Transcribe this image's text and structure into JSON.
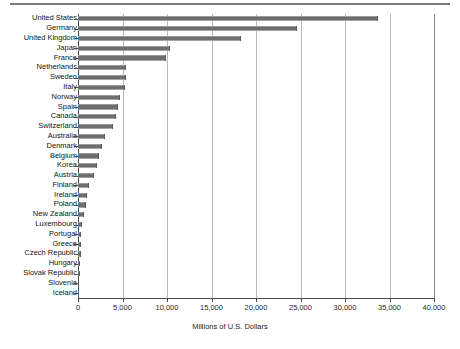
{
  "chart_data": {
    "type": "bar",
    "orientation": "horizontal",
    "title": "",
    "xlabel": "Millions of U.S. Dollars",
    "ylabel": "",
    "xlim": [
      0,
      40000
    ],
    "xticks": [
      0,
      5000,
      10000,
      15000,
      20000,
      25000,
      30000,
      35000,
      40000
    ],
    "xticklabels": [
      "0",
      "5,000",
      "10,000",
      "15,000",
      "20,000",
      "25,000",
      "30,000",
      "35,000",
      "40,000"
    ],
    "grid": "vertical",
    "legend": "none",
    "bar_color": "#6e6e6e",
    "categories": [
      "United States",
      "Germany",
      "United Kingdom",
      "Japan",
      "France",
      "Netherlands",
      "Sweden",
      "Italy",
      "Norway",
      "Spain",
      "Canada",
      "Switzerland",
      "Australia",
      "Denmark",
      "Belgium",
      "Korea",
      "Austria",
      "Finland",
      "Ireland",
      "Poland",
      "New Zealand",
      "Luxembourg",
      "Portugal",
      "Greece",
      "Czech Republic",
      "Hungary",
      "Slovak Republic",
      "Slovenia",
      "Iceland"
    ],
    "values": [
      33700,
      24600,
      18300,
      10300,
      9900,
      5400,
      5400,
      5300,
      4700,
      4450,
      4250,
      3950,
      3050,
      2650,
      2350,
      2100,
      1800,
      1200,
      1000,
      950,
      620,
      400,
      380,
      350,
      330,
      260,
      200,
      120,
      60
    ]
  },
  "axis": {
    "x_title": "Millions of U.S. Dollars"
  }
}
